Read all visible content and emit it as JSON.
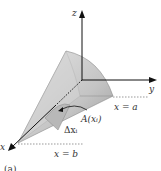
{
  "diagram": {
    "type": "3d-solid-volume-by-cross-sections",
    "axes": {
      "x_label": "x",
      "y_label": "y",
      "z_label": "z"
    },
    "labels": {
      "x_eq_a": "x = a",
      "x_eq_b": "x = b",
      "area": "A(xᵢ)",
      "delta": "Δxᵢ",
      "caption": "(a)"
    },
    "colors": {
      "solid_fill": "#c8c8c8",
      "solid_shade": "#a8a8a8",
      "axis": "#111111",
      "dotted": "#555555"
    }
  }
}
